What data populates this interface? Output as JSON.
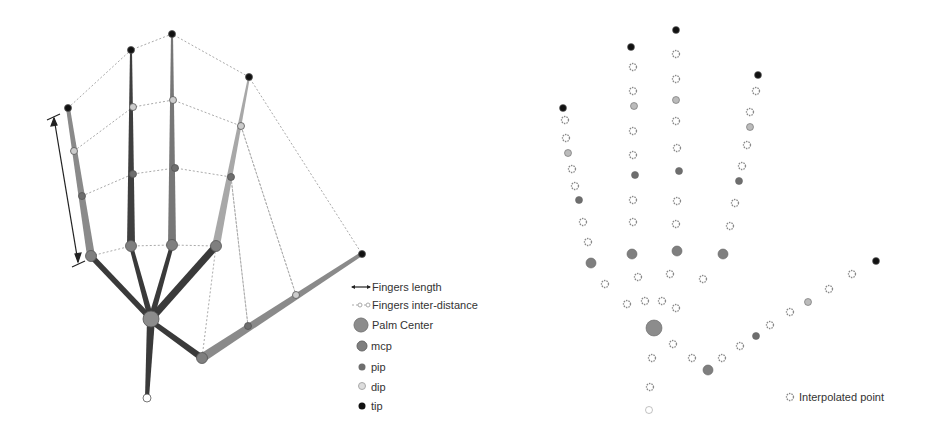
{
  "colors": {
    "tip": "#111111",
    "dip": "#c8c8c8",
    "pip": "#6e6e6e",
    "mcp": "#7f7f7f",
    "palm": "#8c8c8c",
    "bone_dark": "#444444",
    "bone_light": "#9a9a9a",
    "dotted": "#aaaaaa"
  },
  "left_panel": {
    "legend": {
      "items": [
        {
          "icon": "double-arrow-icon",
          "label": "Fingers length"
        },
        {
          "icon": "dotted-line-icon",
          "label": "Fingers inter-distance"
        },
        {
          "icon": "palm-center-marker-icon",
          "label": "Palm Center"
        },
        {
          "icon": "mcp-marker-icon",
          "label": "mcp"
        },
        {
          "icon": "pip-marker-icon",
          "label": "pip"
        },
        {
          "icon": "dip-marker-icon",
          "label": "dip"
        },
        {
          "icon": "tip-marker-icon",
          "label": "tip"
        }
      ]
    }
  },
  "right_panel": {
    "legend": {
      "items": [
        {
          "icon": "interpolated-point-icon",
          "label": "Interpolated point"
        }
      ]
    }
  }
}
